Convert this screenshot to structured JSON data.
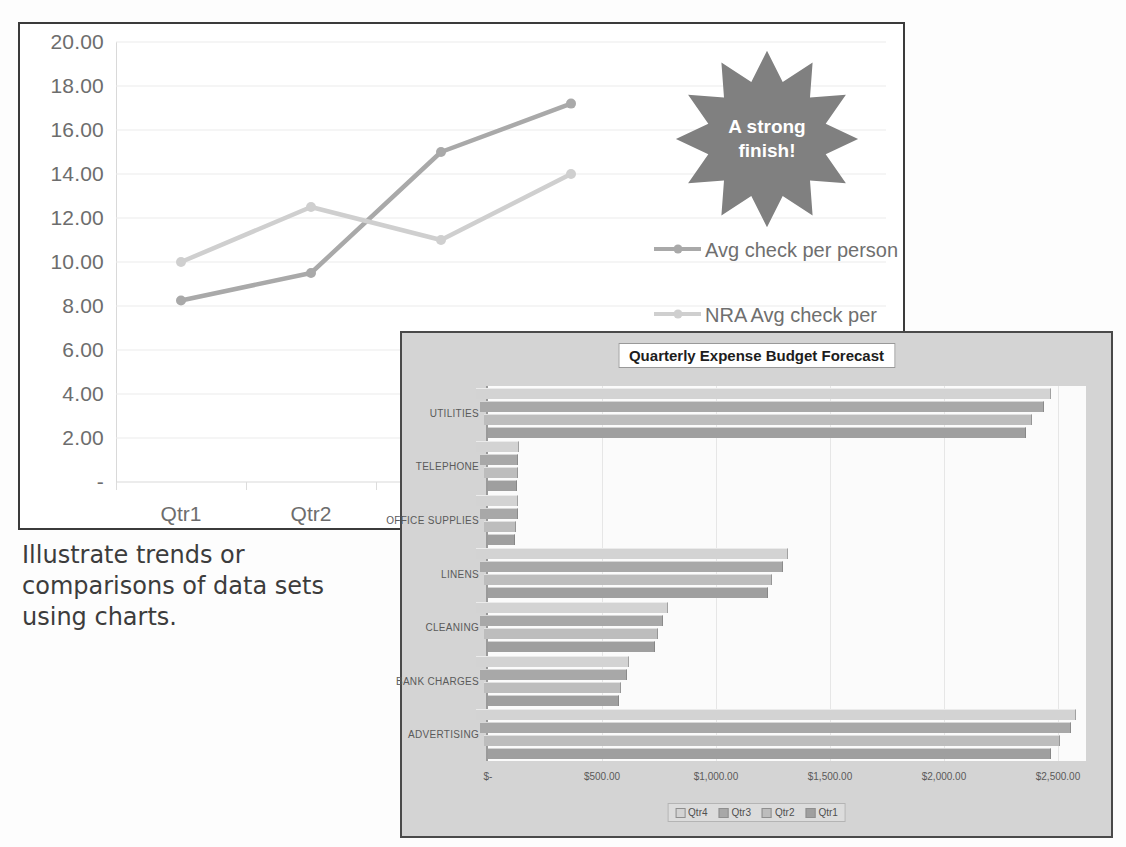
{
  "caption": "Illustrate trends or comparisons of data sets using charts.",
  "callout": {
    "text_line1": "A strong",
    "text_line2": "finish!",
    "color": "#808080"
  },
  "line_chart": {
    "legend": [
      {
        "label": "Avg check per person",
        "color": "#a9a9a9"
      },
      {
        "label": "NRA Avg check per person",
        "color": "#cfcfcf"
      }
    ]
  },
  "bar_chart": {
    "title": "Quarterly Expense Budget Forecast",
    "legend": [
      {
        "label": "Qtr4",
        "color": "#d3d3d3"
      },
      {
        "label": "Qtr3",
        "color": "#a8a8a8"
      },
      {
        "label": "Qtr2",
        "color": "#bdbdbd"
      },
      {
        "label": "Qtr1",
        "color": "#9f9f9f"
      }
    ]
  },
  "chart_data": [
    {
      "type": "line",
      "title": "",
      "xlabel": "",
      "ylabel": "",
      "categories": [
        "Qtr1",
        "Qtr2",
        "Qtr3",
        "Qtr4"
      ],
      "ytick_labels": [
        "20.00",
        "18.00",
        "16.00",
        "14.00",
        "12.00",
        "10.00",
        "8.00",
        "6.00",
        "4.00",
        "2.00",
        "-"
      ],
      "ylim": [
        0,
        20
      ],
      "grid": true,
      "legend_position": "right",
      "series": [
        {
          "name": "Avg check per person",
          "color": "#a9a9a9",
          "values": [
            8.25,
            9.5,
            15.0,
            17.2
          ]
        },
        {
          "name": "NRA Avg check per person",
          "color": "#cfcfcf",
          "values": [
            10.0,
            12.5,
            11.0,
            14.0
          ]
        }
      ],
      "annotations": [
        "A strong finish!"
      ]
    },
    {
      "type": "bar",
      "orientation": "horizontal",
      "title": "Quarterly Expense Budget Forecast",
      "xlabel": "",
      "ylabel": "",
      "categories": [
        "UTILITIES",
        "TELEPHONE",
        "OFFICE SUPPLIES",
        "LINENS",
        "CLEANING",
        "BANK CHARGES",
        "ADVERTISING"
      ],
      "xtick_labels": [
        "$-",
        "$500.00",
        "$1,000.00",
        "$1,500.00",
        "$2,000.00",
        "$2,500.00"
      ],
      "xlim": [
        0,
        2500
      ],
      "grid": true,
      "legend_position": "bottom",
      "series": [
        {
          "name": "Qtr4",
          "color": "#d3d3d3",
          "values": [
            2450,
            120,
            115,
            1300,
            770,
            600,
            2560
          ]
        },
        {
          "name": "Qtr3",
          "color": "#a8a8a8",
          "values": [
            2420,
            115,
            112,
            1275,
            750,
            590,
            2540
          ]
        },
        {
          "name": "Qtr2",
          "color": "#bdbdbd",
          "values": [
            2370,
            112,
            105,
            1230,
            730,
            565,
            2490
          ]
        },
        {
          "name": "Qtr1",
          "color": "#9f9f9f",
          "values": [
            2340,
            108,
            100,
            1210,
            715,
            555,
            2450
          ]
        }
      ]
    }
  ]
}
